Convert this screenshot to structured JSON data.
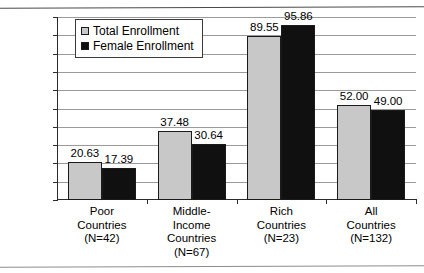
{
  "chart_data": {
    "type": "bar",
    "title": "",
    "xlabel": "",
    "ylabel": "",
    "ylim": [
      0,
      100
    ],
    "ytick_step": 10,
    "ytick_labels": [
      "0.00",
      "10.00",
      "20.00",
      "30.00",
      "40.00",
      "50.00",
      "60.00",
      "70.00",
      "80.00",
      "90.00",
      "100.00"
    ],
    "grid": true,
    "legend_position": "top-left-inside",
    "categories": [
      "Poor Countries (N=42)",
      "Middle-Income Countries (N=67)",
      "Rich Countries (N=23)",
      "All Countries (N=132)"
    ],
    "category_lines": [
      [
        "Poor",
        "Countries",
        "(N=42)"
      ],
      [
        "Middle-",
        "Income",
        "Countries",
        "(N=67)"
      ],
      [
        "Rich",
        "Countries",
        "(N=23)"
      ],
      [
        "All",
        "Countries",
        "(N=132)"
      ]
    ],
    "series": [
      {
        "name": "Total Enrollment",
        "color": "#c8c8c8",
        "values": [
          20.63,
          37.48,
          89.55,
          52.0
        ],
        "labels": [
          "20.63",
          "37.48",
          "89.55",
          "52.00"
        ]
      },
      {
        "name": "Female Enrollment",
        "color": "#101010",
        "values": [
          17.39,
          30.64,
          95.86,
          49.0
        ],
        "labels": [
          "17.39",
          "30.64",
          "95.86",
          "49.00"
        ]
      }
    ]
  },
  "legend": {
    "items": [
      {
        "label": "Total Enrollment",
        "swatch": "legend-swatch-total"
      },
      {
        "label": "Female Enrollment",
        "swatch": "legend-swatch-female"
      }
    ]
  }
}
